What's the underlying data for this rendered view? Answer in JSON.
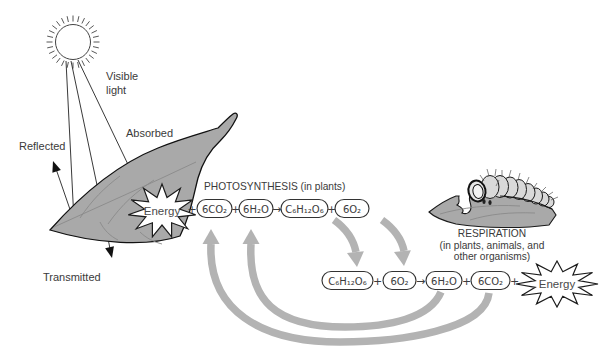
{
  "diagram": {
    "sun_label": {
      "line1": "Visible",
      "line2": "light"
    },
    "light": {
      "reflected": "Reflected",
      "absorbed": "Absorbed",
      "transmitted": "Transmitted"
    },
    "photosynthesis": {
      "title": "PHOTOSYNTHESIS (in plants)",
      "energy_label": "Energy",
      "terms": [
        "6CO₂",
        "6H₂O",
        "C₆H₁₂O₆",
        "6O₂"
      ]
    },
    "respiration": {
      "title": "RESPIRATION",
      "subtitle_line1": "(in plants, animals, and",
      "subtitle_line2": "other organisms)",
      "energy_label": "Energy",
      "terms": [
        "C₆H₁₂O₆",
        "6O₂",
        "6H₂O",
        "6CO₂"
      ]
    },
    "operators": {
      "plus": "+",
      "arrow": "→"
    },
    "colors": {
      "leaf_fill": "#a9a9a9",
      "leaf_vein": "#8a8a8a",
      "cycle_arrow": "#b3b3b3",
      "ink": "#222222",
      "background": "#ffffff"
    }
  }
}
